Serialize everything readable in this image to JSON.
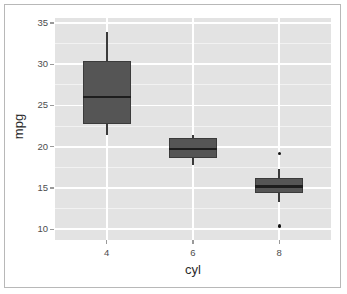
{
  "chart_data": {
    "type": "box",
    "title": "",
    "xlabel": "cyl",
    "ylabel": "mpg",
    "categories": [
      "4",
      "6",
      "8"
    ],
    "xlim": [
      0.4,
      3.6
    ],
    "ylim": [
      8.7,
      35.6
    ],
    "ytick_values": [
      10,
      15,
      20,
      25,
      30,
      35
    ],
    "ytick_labels": [
      "10",
      "15",
      "20",
      "25",
      "30",
      "35"
    ],
    "xtick_labels": [
      "4",
      "6",
      "8"
    ],
    "grid": true,
    "legend": "none",
    "panel_background": "#e3e3e3",
    "gridline_color": "#ffffff",
    "box_fill": "#555555",
    "box_line": "#3b3b3b",
    "median_color": "#1d1d1d",
    "outlier_color": "#121212",
    "boxes": [
      {
        "category": "4",
        "lower_whisker": 21.4,
        "q1": 22.8,
        "median": 26.0,
        "q3": 30.4,
        "upper_whisker": 33.9,
        "outliers": []
      },
      {
        "category": "6",
        "lower_whisker": 17.8,
        "q1": 18.65,
        "median": 19.7,
        "q3": 21.0,
        "upper_whisker": 21.4,
        "outliers": []
      },
      {
        "category": "8",
        "lower_whisker": 13.3,
        "q1": 14.4,
        "median": 15.2,
        "q3": 16.25,
        "upper_whisker": 17.3,
        "outliers": [
          19.2,
          10.4
        ]
      }
    ]
  },
  "axis": {
    "x_title": "cyl",
    "y_title": "mpg"
  }
}
